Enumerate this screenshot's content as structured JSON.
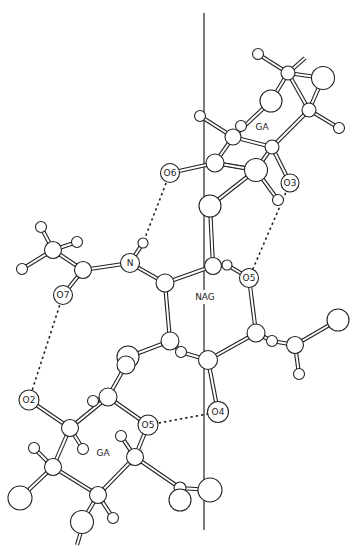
{
  "figure": {
    "residues": [
      {
        "id": "ga_top",
        "label": "GA"
      },
      {
        "id": "nag",
        "label": "NAG"
      },
      {
        "id": "ga_bottom",
        "label": "GA"
      }
    ],
    "atom_labels": [
      {
        "id": "o6",
        "label": "O6"
      },
      {
        "id": "o3",
        "label": "O3"
      },
      {
        "id": "n",
        "label": "N"
      },
      {
        "id": "o5_nag",
        "label": "O5"
      },
      {
        "id": "o7",
        "label": "O7"
      },
      {
        "id": "o2",
        "label": "O2"
      },
      {
        "id": "o5_ga",
        "label": "O5"
      },
      {
        "id": "o4",
        "label": "O4"
      }
    ],
    "hydrogen_bonds": [
      {
        "from": "O6",
        "to": "H(N)"
      },
      {
        "from": "O3",
        "to": "O5"
      },
      {
        "from": "O7",
        "to": "O2"
      },
      {
        "from": "O5",
        "to": "O4"
      }
    ]
  }
}
